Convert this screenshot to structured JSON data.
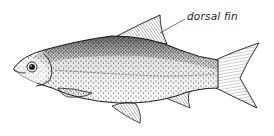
{
  "diagram": {
    "labels": [
      {
        "text": "dorsal fin",
        "points_to": "dorsal-fin"
      }
    ]
  },
  "colors": {
    "background": "#ffffff",
    "ink": "#1a1a1a",
    "stipple": "#2a2a2a"
  }
}
